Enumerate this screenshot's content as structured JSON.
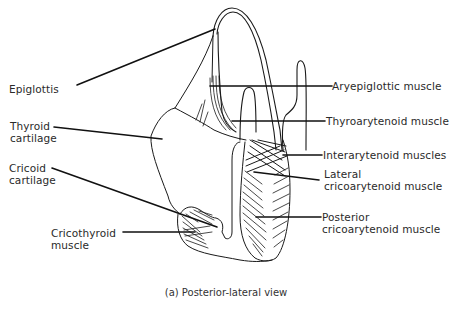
{
  "figure": {
    "caption": "(a) Posterior-lateral view",
    "stroke_color": "#1a1a1a",
    "background": "#ffffff"
  },
  "labels": {
    "left": [
      {
        "id": "epiglottis",
        "lines": [
          "Epiglottis"
        ]
      },
      {
        "id": "thyroid-cartilage",
        "lines": [
          "Thyroid",
          "cartilage"
        ]
      },
      {
        "id": "cricoid-cartilage",
        "lines": [
          "Cricoid",
          "cartilage"
        ]
      },
      {
        "id": "cricothyroid-muscle",
        "lines": [
          "Cricothyroid",
          "muscle"
        ]
      }
    ],
    "right": [
      {
        "id": "aryepiglottic-muscle",
        "lines": [
          "Aryepiglottic muscle"
        ]
      },
      {
        "id": "thyroarytenoid-muscle",
        "lines": [
          "Thyroarytenoid muscle"
        ]
      },
      {
        "id": "interarytenoid-muscles",
        "lines": [
          "Interarytenoid muscles"
        ]
      },
      {
        "id": "lateral-cricoarytenoid-muscle",
        "lines": [
          "Lateral",
          "cricoarytenoid muscle"
        ]
      },
      {
        "id": "posterior-cricoarytenoid-muscle",
        "lines": [
          "Posterior",
          "cricoarytenoid muscle"
        ]
      }
    ]
  }
}
